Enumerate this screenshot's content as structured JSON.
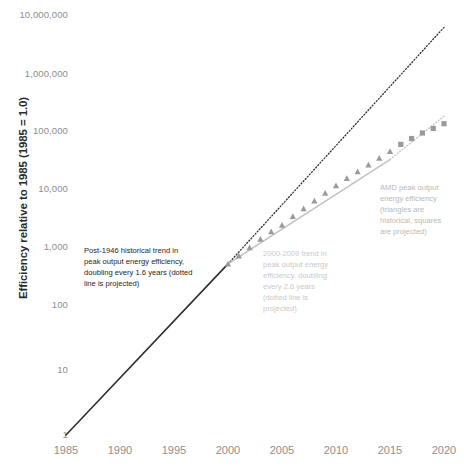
{
  "chart_data": {
    "type": "line",
    "title": "",
    "xlabel": "",
    "ylabel": "Efficiency relative to 1985 (1985 = 1.0)",
    "yscale": "log",
    "xlim": [
      1985,
      2020
    ],
    "ylim": [
      1,
      10000000
    ],
    "grid": false,
    "legend": "none",
    "ytick_labels": [
      "10,000,000",
      "1,000,000",
      "100,000",
      "10,000",
      "1,000",
      "100",
      "10",
      "1"
    ],
    "ytick_values": [
      10000000,
      1000000,
      100000,
      10000,
      1000,
      100,
      10,
      1
    ],
    "xtick_labels": [
      "1985",
      "1990",
      "1995",
      "2000",
      "2005",
      "2010",
      "2015",
      "2020"
    ],
    "xtick_values": [
      1985,
      1990,
      1995,
      2000,
      2005,
      2010,
      2015,
      2020
    ],
    "series": [
      {
        "name": "Post-1946 historical trend (solid, historical)",
        "style": "solid",
        "color": "#2e2e2e",
        "doubling_years": 1.6,
        "x": [
          1985,
          2000
        ],
        "y": [
          1,
          700
        ]
      },
      {
        "name": "Post-1946 historical trend (dotted, projected)",
        "style": "dotted",
        "color": "#2e2e2e",
        "doubling_years": 1.6,
        "x": [
          2000,
          2020
        ],
        "y": [
          700,
          6000000
        ]
      },
      {
        "name": "2000-2009 trend (solid, historical)",
        "style": "solid",
        "color": "#c2c2c2",
        "doubling_years": 2.6,
        "x": [
          2000,
          2015
        ],
        "y": [
          700,
          38000
        ]
      },
      {
        "name": "2000-2009 trend (dotted, projected)",
        "style": "dotted",
        "color": "#c2c2c2",
        "doubling_years": 2.6,
        "x": [
          2015,
          2020
        ],
        "y": [
          38000,
          200000
        ]
      },
      {
        "name": "AMD peak output energy efficiency (historical)",
        "style": "markers",
        "marker": "triangle",
        "color": "#9a9a9a",
        "x": [
          2000,
          2001,
          2002,
          2003,
          2004,
          2005,
          2006,
          2007,
          2008,
          2009,
          2010,
          2011,
          2012,
          2013,
          2014,
          2015
        ],
        "y": [
          700,
          950,
          1300,
          1800,
          2400,
          3100,
          4300,
          5800,
          7800,
          10500,
          14000,
          18500,
          24000,
          31000,
          40000,
          52000
        ]
      },
      {
        "name": "AMD peak output energy efficiency (projected)",
        "style": "markers",
        "marker": "square",
        "color": "#9a9a9a",
        "x": [
          2016,
          2017,
          2018,
          2019,
          2020
        ],
        "y": [
          68000,
          85000,
          105000,
          125000,
          150000
        ]
      }
    ],
    "annotations": [
      {
        "id": "post-1946-trend",
        "text": "Post-1946 historical trend in\npeak output energy efficiency,\ndoubling every 1.6 years (dotted\nline is projected)",
        "color": "#262626",
        "x_px": 84,
        "y_px": 245
      },
      {
        "id": "2000-2009-trend",
        "text": "2000-2009 trend in\npeak output energy\nefficiency, doubling\nevery 2.6 years\n(dotted line is\nprojected)",
        "color": "#c9c9c9",
        "x_px": 263,
        "y_px": 248
      },
      {
        "id": "amd-series-note",
        "text": "AMD peak output\nenergy efficiency\n(triangles are\nhistorical, squares\nare projected)",
        "color": "#b9b9b9",
        "x_px": 380,
        "y_px": 182
      }
    ]
  }
}
